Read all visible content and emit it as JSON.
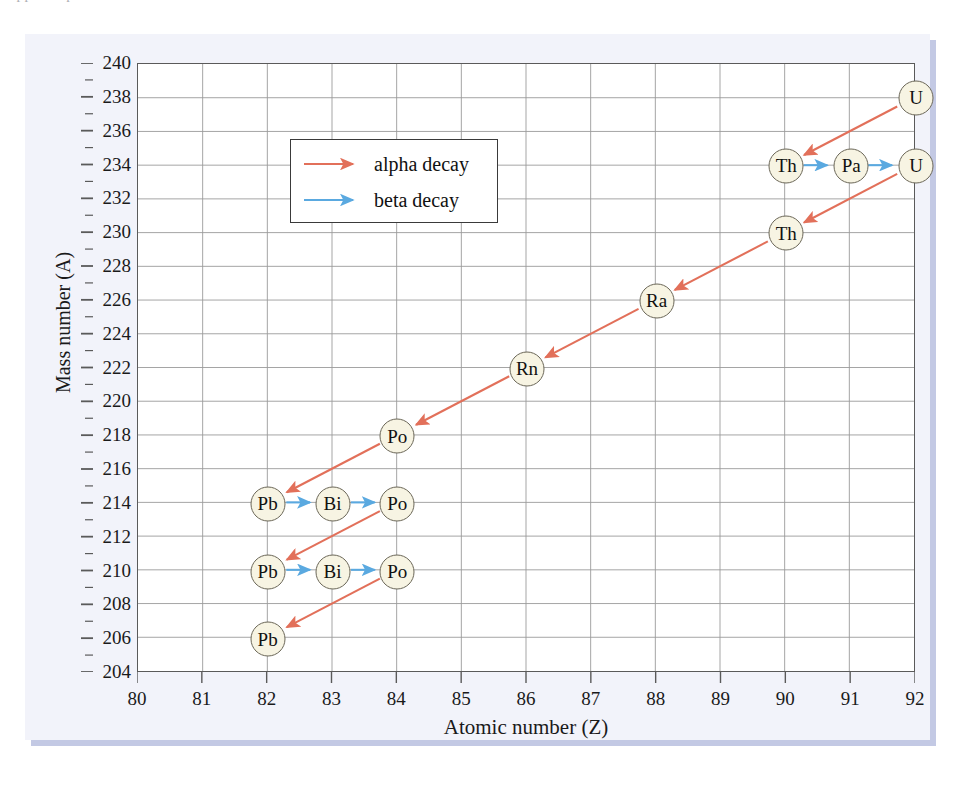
{
  "scan_artifact": {
    "top_cut_text": "clipped caption line"
  },
  "figure": {
    "axis": {
      "x_title": "Atomic number (Z)",
      "y_title": "Mass number (A)",
      "x_ticks": [
        "80",
        "81",
        "82",
        "83",
        "84",
        "85",
        "86",
        "87",
        "88",
        "89",
        "90",
        "91",
        "92"
      ],
      "y_ticks": [
        "240",
        "238",
        "236",
        "234",
        "232",
        "230",
        "228",
        "226",
        "224",
        "222",
        "220",
        "218",
        "216",
        "214",
        "212",
        "210",
        "208",
        "206",
        "204"
      ]
    },
    "legend": {
      "items": [
        {
          "label": "alpha decay",
          "color": "#e2705a",
          "name": "alpha"
        },
        {
          "label": "beta decay",
          "color": "#5aa9e0",
          "name": "beta"
        }
      ]
    }
  },
  "colors": {
    "alpha": "#e2705a",
    "beta": "#5aa9e0",
    "node_fill": "#f7f4e3",
    "node_stroke": "#6b6758",
    "grid": "#9a9a9a",
    "frame": "#5a5a5a",
    "panel_bg": "#f2f3fa",
    "panel_shadow": "#c3c9e4"
  },
  "chart_data": {
    "type": "scatter",
    "title": "",
    "subtitle": "",
    "xlabel": "Atomic number (Z)",
    "ylabel": "Mass number (A)",
    "xlim": [
      80,
      92
    ],
    "ylim": [
      204,
      240
    ],
    "xticks": [
      80,
      81,
      82,
      83,
      84,
      85,
      86,
      87,
      88,
      89,
      90,
      91,
      92
    ],
    "yticks": [
      240,
      238,
      236,
      234,
      232,
      230,
      228,
      226,
      224,
      222,
      220,
      218,
      216,
      214,
      212,
      210,
      208,
      206,
      204
    ],
    "grid": true,
    "legend_position": "upper-left-inside",
    "legend": [
      "alpha decay",
      "beta decay"
    ],
    "nodes": [
      {
        "label": "U",
        "z": 92,
        "a": 238
      },
      {
        "label": "Th",
        "z": 90,
        "a": 234
      },
      {
        "label": "Pa",
        "z": 91,
        "a": 234
      },
      {
        "label": "U",
        "z": 92,
        "a": 234
      },
      {
        "label": "Th",
        "z": 90,
        "a": 230
      },
      {
        "label": "Ra",
        "z": 88,
        "a": 226
      },
      {
        "label": "Rn",
        "z": 86,
        "a": 222
      },
      {
        "label": "Po",
        "z": 84,
        "a": 218
      },
      {
        "label": "Pb",
        "z": 82,
        "a": 214
      },
      {
        "label": "Bi",
        "z": 83,
        "a": 214
      },
      {
        "label": "Po",
        "z": 84,
        "a": 214
      },
      {
        "label": "Pb",
        "z": 82,
        "a": 210
      },
      {
        "label": "Bi",
        "z": 83,
        "a": 210
      },
      {
        "label": "Po",
        "z": 84,
        "a": 210
      },
      {
        "label": "Pb",
        "z": 82,
        "a": 206
      }
    ],
    "edges": [
      {
        "from": [
          92,
          238
        ],
        "to": [
          90,
          234
        ],
        "decay": "alpha"
      },
      {
        "from": [
          90,
          234
        ],
        "to": [
          91,
          234
        ],
        "decay": "beta"
      },
      {
        "from": [
          91,
          234
        ],
        "to": [
          92,
          234
        ],
        "decay": "beta"
      },
      {
        "from": [
          92,
          234
        ],
        "to": [
          90,
          230
        ],
        "decay": "alpha"
      },
      {
        "from": [
          90,
          230
        ],
        "to": [
          88,
          226
        ],
        "decay": "alpha"
      },
      {
        "from": [
          88,
          226
        ],
        "to": [
          86,
          222
        ],
        "decay": "alpha"
      },
      {
        "from": [
          86,
          222
        ],
        "to": [
          84,
          218
        ],
        "decay": "alpha"
      },
      {
        "from": [
          84,
          218
        ],
        "to": [
          82,
          214
        ],
        "decay": "alpha"
      },
      {
        "from": [
          82,
          214
        ],
        "to": [
          83,
          214
        ],
        "decay": "beta"
      },
      {
        "from": [
          83,
          214
        ],
        "to": [
          84,
          214
        ],
        "decay": "beta"
      },
      {
        "from": [
          84,
          214
        ],
        "to": [
          82,
          210
        ],
        "decay": "alpha"
      },
      {
        "from": [
          82,
          210
        ],
        "to": [
          83,
          210
        ],
        "decay": "beta"
      },
      {
        "from": [
          83,
          210
        ],
        "to": [
          84,
          210
        ],
        "decay": "beta"
      },
      {
        "from": [
          84,
          210
        ],
        "to": [
          82,
          206
        ],
        "decay": "alpha"
      }
    ]
  }
}
